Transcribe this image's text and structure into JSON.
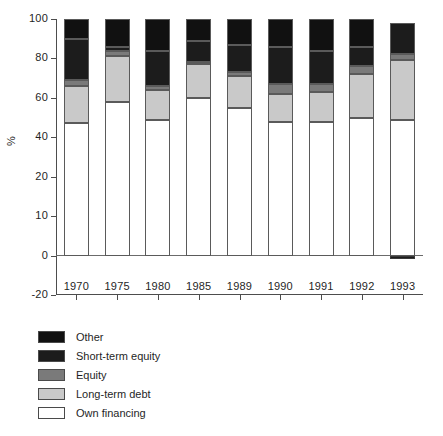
{
  "chart_data": {
    "type": "bar",
    "variant": "stacked-vertical",
    "title": "",
    "subtitle": "",
    "xlabel": "",
    "ylabel": "%",
    "categories": [
      "1970",
      "1975",
      "1980",
      "1985",
      "1989",
      "1990",
      "1991",
      "1992",
      "1993"
    ],
    "ytick_labels": [
      "100",
      "80",
      "60",
      "40",
      "20",
      "10",
      "0",
      "-20"
    ],
    "ytick_values": [
      100,
      80,
      60,
      40,
      20,
      10,
      0,
      -20
    ],
    "ylim": [
      -20,
      100
    ],
    "grid": false,
    "legend_position": "below-axes-left",
    "stack_order_bottom_to_top": [
      "Own financing",
      "Long-term debt",
      "Equity",
      "Short-term equity",
      "Other"
    ],
    "series": [
      {
        "name": "Own financing",
        "color": "#ffffff",
        "values": [
          47,
          58,
          49,
          60,
          55,
          48,
          48,
          50,
          49
        ]
      },
      {
        "name": "Long-term debt",
        "color": "#c9c9c9",
        "values": [
          19,
          23,
          15,
          17,
          16,
          14,
          15,
          22,
          30
        ]
      },
      {
        "name": "Equity",
        "color": "#7a7a7a",
        "values": [
          3,
          3,
          2,
          1,
          2,
          5,
          4,
          4,
          3
        ]
      },
      {
        "name": "Short-term equity",
        "color": "#1c1c1c",
        "values": [
          21,
          2,
          18,
          11,
          14,
          19,
          17,
          10,
          16
        ]
      },
      {
        "name": "Other",
        "color": "#111111",
        "values": [
          10,
          14,
          16,
          11,
          13,
          14,
          16,
          14,
          0
        ]
      },
      {
        "name": "negative",
        "color": "#1c1c1c",
        "values": [
          0,
          0,
          0,
          0,
          0,
          0,
          0,
          0,
          -1.5
        ]
      }
    ]
  },
  "axes": {
    "y_title": "%",
    "y_ticks": [
      {
        "label": "100"
      },
      {
        "label": "80"
      },
      {
        "label": "60"
      },
      {
        "label": "40"
      },
      {
        "label": "20"
      },
      {
        "label": "10"
      },
      {
        "label": "0"
      },
      {
        "label": "-20"
      }
    ],
    "x_ticks": [
      {
        "label": "1970"
      },
      {
        "label": "1975"
      },
      {
        "label": "1980"
      },
      {
        "label": "1985"
      },
      {
        "label": "1989"
      },
      {
        "label": "1990"
      },
      {
        "label": "1991"
      },
      {
        "label": "1992"
      },
      {
        "label": "1993"
      }
    ]
  },
  "legend": {
    "items": [
      {
        "label": "Other",
        "color": "#111111"
      },
      {
        "label": "Short-term equity",
        "color": "#1c1c1c"
      },
      {
        "label": "Equity",
        "color": "#7a7a7a"
      },
      {
        "label": "Long-term debt",
        "color": "#c9c9c9"
      },
      {
        "label": "Own financing",
        "color": "#ffffff"
      }
    ]
  },
  "caption": {
    "text": ""
  },
  "colors": {
    "axis": "#4d4d4d",
    "zero_line": "#6b6b6b",
    "segment_border": "#5a5a5a",
    "text": "#1f1f1f",
    "background": "#ffffff"
  }
}
